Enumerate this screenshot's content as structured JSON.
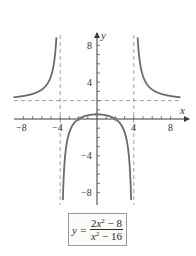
{
  "chart_data": {
    "type": "line",
    "title": "",
    "xlabel": "x",
    "ylabel": "y",
    "xlim": [
      -9,
      9
    ],
    "ylim": [
      -9,
      9
    ],
    "grid": false,
    "x_ticks": [
      -8,
      -7,
      -6,
      -5,
      -4,
      -3,
      -2,
      -1,
      1,
      2,
      3,
      4,
      5,
      6,
      7,
      8
    ],
    "y_ticks": [
      -8,
      -7,
      -6,
      -5,
      -4,
      -3,
      -2,
      -1,
      1,
      2,
      3,
      4,
      5,
      6,
      7,
      8
    ],
    "x_tick_labels": [
      "-8",
      "-4",
      "4",
      "8"
    ],
    "y_tick_labels": [
      "8",
      "4",
      "-4",
      "-8"
    ],
    "function": "y = (2x^2 - 8)/(x^2 - 16)",
    "asymptotes": {
      "vertical": [
        -4,
        4
      ],
      "horizontal": [
        2
      ]
    },
    "series": [
      {
        "name": "left branch",
        "x": [
          -9,
          -8,
          -7,
          -6,
          -5,
          -4.6,
          -4.42
        ],
        "y": [
          2.37,
          2.5,
          2.73,
          3.2,
          4.67,
          6.3,
          8.8
        ]
      },
      {
        "name": "middle branch",
        "x": [
          -3.71,
          -3.5,
          -3,
          -2,
          -1,
          0,
          1,
          2,
          3,
          3.5,
          3.71
        ],
        "y": [
          -8.8,
          -5.6,
          -1.43,
          0,
          0.4,
          0.5,
          0.4,
          0,
          -1.43,
          -5.6,
          -8.8
        ]
      },
      {
        "name": "right branch",
        "x": [
          4.42,
          4.6,
          5,
          6,
          7,
          8,
          9
        ],
        "y": [
          8.8,
          6.3,
          4.67,
          3.2,
          2.73,
          2.5,
          2.37
        ]
      }
    ],
    "marked_points": [
      {
        "x": -2,
        "y": 0
      },
      {
        "x": 0,
        "y": 0.5
      },
      {
        "x": 2,
        "y": 0
      }
    ],
    "legend": null
  },
  "labels": {
    "x_axis": "x",
    "y_axis": "y",
    "tick_x_neg8": "−8",
    "tick_x_neg4": "−4",
    "tick_x_4": "4",
    "tick_x_8": "8",
    "tick_y_8": "8",
    "tick_y_4": "4",
    "tick_y_neg4": "−4",
    "tick_y_neg8": "−8"
  },
  "equation": {
    "lhs": "y =",
    "numerator_a": "2",
    "numerator_var": "x",
    "numerator_exp": "2",
    "numerator_rest": " − 8",
    "denominator_var": "x",
    "denominator_exp": "2",
    "denominator_rest": " − 16"
  },
  "colors": {
    "curve": "#6b6b6b",
    "axis": "#3a3a3a",
    "asymptote": "#8a8a8a"
  }
}
